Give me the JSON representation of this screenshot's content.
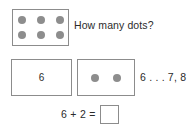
{
  "worksheet": {
    "background_color": "#ffffff",
    "box_border_color": "#8c8c8c",
    "dot_color": "#8d8d8d",
    "text_color": "#2b2b2b",
    "prompt": "How many dots?",
    "count_on_sequence": "6 . . . 7, 8",
    "equation_expression": "6 + 2 =",
    "answer_value": "",
    "addend_numeral": "6",
    "top_box": {
      "dot_count": 6,
      "rows": [
        [
          {
            "name": "dot"
          },
          {
            "name": "dot"
          },
          {
            "name": "dot"
          }
        ],
        [
          {
            "name": "dot"
          },
          {
            "name": "dot"
          },
          {
            "name": "dot"
          }
        ]
      ]
    },
    "second_box": {
      "dot_count": 2,
      "rows": [
        [
          {
            "name": "dot"
          },
          {
            "name": "dot"
          }
        ]
      ]
    }
  }
}
